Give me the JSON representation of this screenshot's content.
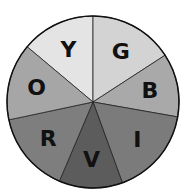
{
  "diagram": {
    "title": "",
    "type": "color-wheel",
    "segments": [
      {
        "label": "Y",
        "name": "yellow",
        "start_deg": 310,
        "end_deg": 360,
        "fill": "#e4e4e4"
      },
      {
        "label": "G",
        "name": "green",
        "start_deg": 0,
        "end_deg": 57,
        "fill": "#d3d3d3"
      },
      {
        "label": "B",
        "name": "blue",
        "start_deg": 57,
        "end_deg": 100,
        "fill": "#a9a9a9"
      },
      {
        "label": "I",
        "name": "indigo",
        "start_deg": 100,
        "end_deg": 160,
        "fill": "#7b7b7b"
      },
      {
        "label": "V",
        "name": "violet",
        "start_deg": 160,
        "end_deg": 203,
        "fill": "#5c5c5c"
      },
      {
        "label": "R",
        "name": "red",
        "start_deg": 203,
        "end_deg": 258,
        "fill": "#7e7e7e"
      },
      {
        "label": "O",
        "name": "orange",
        "start_deg": 258,
        "end_deg": 310,
        "fill": "#a6a6a6"
      }
    ]
  }
}
